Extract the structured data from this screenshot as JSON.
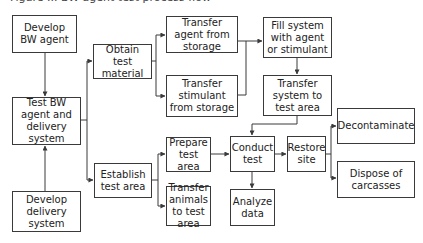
{
  "diagram": {
    "caption_fragment": "Figure ... BW agent test process flow",
    "nodes": [
      {
        "id": "develop_agent",
        "label": "Develop BW agent",
        "x": 12,
        "y": 15,
        "w": 65,
        "h": 38
      },
      {
        "id": "test_agent_delivery",
        "label": "Test BW agent and delivery system",
        "x": 12,
        "y": 97,
        "w": 69,
        "h": 48
      },
      {
        "id": "develop_delivery",
        "label": "Develop delivery system",
        "x": 12,
        "y": 191,
        "w": 69,
        "h": 41
      },
      {
        "id": "obtain_material",
        "label": "Obtain test material",
        "x": 93,
        "y": 44,
        "w": 59,
        "h": 35
      },
      {
        "id": "establish_area",
        "label": "Establish test area",
        "x": 94,
        "y": 163,
        "w": 58,
        "h": 35
      },
      {
        "id": "transfer_agent",
        "label": "Transfer agent from storage",
        "x": 166,
        "y": 16,
        "w": 72,
        "h": 37
      },
      {
        "id": "transfer_stimulant",
        "label": "Transfer stimulant from storage",
        "x": 166,
        "y": 75,
        "w": 72,
        "h": 42
      },
      {
        "id": "fill_system",
        "label": "Fill system with agent or stimulant",
        "x": 263,
        "y": 17,
        "w": 69,
        "h": 41
      },
      {
        "id": "transfer_system",
        "label": "Transfer system to test area",
        "x": 263,
        "y": 75,
        "w": 69,
        "h": 41
      },
      {
        "id": "prepare_area",
        "label": "Prepare test area",
        "x": 166,
        "y": 137,
        "w": 45,
        "h": 35
      },
      {
        "id": "transfer_animals",
        "label": "Transfer animals to test area",
        "x": 166,
        "y": 186,
        "w": 45,
        "h": 40
      },
      {
        "id": "conduct_test",
        "label": "Conduct test",
        "x": 230,
        "y": 136,
        "w": 45,
        "h": 36
      },
      {
        "id": "restore_site",
        "label": "Restore site",
        "x": 287,
        "y": 136,
        "w": 39,
        "h": 36
      },
      {
        "id": "analyze_data",
        "label": "Analyze data",
        "x": 230,
        "y": 189,
        "w": 45,
        "h": 37
      },
      {
        "id": "decontaminate",
        "label": "Decontaminate",
        "x": 337,
        "y": 108,
        "w": 78,
        "h": 36
      },
      {
        "id": "dispose_carcasses",
        "label": "Dispose of carcasses",
        "x": 337,
        "y": 161,
        "w": 78,
        "h": 37
      }
    ],
    "edges": [
      {
        "from": "develop_agent",
        "to": "test_agent_delivery"
      },
      {
        "from": "develop_delivery",
        "to": "test_agent_delivery"
      },
      {
        "from": "test_agent_delivery",
        "to": "obtain_material"
      },
      {
        "from": "test_agent_delivery",
        "to": "establish_area"
      },
      {
        "from": "obtain_material",
        "to": "transfer_agent"
      },
      {
        "from": "obtain_material",
        "to": "transfer_stimulant"
      },
      {
        "from": "transfer_agent",
        "to": "fill_system"
      },
      {
        "from": "transfer_stimulant",
        "to": "fill_system"
      },
      {
        "from": "fill_system",
        "to": "transfer_system"
      },
      {
        "from": "transfer_system",
        "to": "conduct_test"
      },
      {
        "from": "establish_area",
        "to": "prepare_area"
      },
      {
        "from": "establish_area",
        "to": "transfer_animals"
      },
      {
        "from": "prepare_area",
        "to": "conduct_test"
      },
      {
        "from": "conduct_test",
        "to": "restore_site"
      },
      {
        "from": "conduct_test",
        "to": "analyze_data"
      },
      {
        "from": "restore_site",
        "to": "decontaminate"
      },
      {
        "from": "restore_site",
        "to": "dispose_carcasses"
      }
    ],
    "colors": {
      "line": "#3a3a3a",
      "text": "#222222",
      "background": "#ffffff"
    }
  }
}
